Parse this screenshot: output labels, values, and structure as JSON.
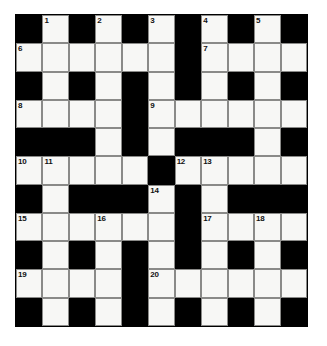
{
  "puzzle": {
    "type": "crossword-grid",
    "title": "Crossword Puzzle Grid",
    "rows": 11,
    "cols": 11,
    "colors": {
      "block": "#000000",
      "open": "#f7f7f5",
      "cell_border": "#8a8a88",
      "number_text": "#111111",
      "background": "#ffffff"
    },
    "legend": {
      "block_label": "blocked square",
      "open_label": "fillable square"
    },
    "grid": [
      [
        "block",
        "open",
        "block",
        "open",
        "block",
        "open",
        "block",
        "open",
        "block",
        "open",
        "block"
      ],
      [
        "open",
        "open",
        "open",
        "open",
        "open",
        "open",
        "block",
        "open",
        "open",
        "open",
        "open"
      ],
      [
        "block",
        "open",
        "block",
        "open",
        "block",
        "open",
        "block",
        "open",
        "block",
        "open",
        "block"
      ],
      [
        "open",
        "open",
        "open",
        "open",
        "block",
        "open",
        "open",
        "open",
        "open",
        "open",
        "open"
      ],
      [
        "block",
        "block",
        "block",
        "open",
        "block",
        "open",
        "block",
        "block",
        "block",
        "open",
        "block"
      ],
      [
        "open",
        "open",
        "open",
        "open",
        "open",
        "block",
        "open",
        "open",
        "open",
        "open",
        "open"
      ],
      [
        "block",
        "open",
        "block",
        "block",
        "block",
        "open",
        "block",
        "open",
        "block",
        "block",
        "block"
      ],
      [
        "open",
        "open",
        "open",
        "open",
        "open",
        "open",
        "block",
        "open",
        "open",
        "open",
        "open"
      ],
      [
        "block",
        "open",
        "block",
        "open",
        "block",
        "open",
        "block",
        "open",
        "block",
        "open",
        "block"
      ],
      [
        "open",
        "open",
        "open",
        "open",
        "block",
        "open",
        "open",
        "open",
        "open",
        "open",
        "open"
      ],
      [
        "block",
        "open",
        "block",
        "open",
        "block",
        "open",
        "block",
        "open",
        "block",
        "open",
        "block"
      ]
    ],
    "numbers": [
      {
        "n": "1",
        "row": 0,
        "col": 1
      },
      {
        "n": "2",
        "row": 0,
        "col": 3
      },
      {
        "n": "3",
        "row": 0,
        "col": 5
      },
      {
        "n": "4",
        "row": 0,
        "col": 7
      },
      {
        "n": "5",
        "row": 0,
        "col": 9
      },
      {
        "n": "6",
        "row": 1,
        "col": 0
      },
      {
        "n": "7",
        "row": 1,
        "col": 7
      },
      {
        "n": "8",
        "row": 3,
        "col": 0
      },
      {
        "n": "9",
        "row": 3,
        "col": 5
      },
      {
        "n": "10",
        "row": 5,
        "col": 0
      },
      {
        "n": "11",
        "row": 5,
        "col": 1
      },
      {
        "n": "12",
        "row": 5,
        "col": 6
      },
      {
        "n": "13",
        "row": 5,
        "col": 7
      },
      {
        "n": "14",
        "row": 6,
        "col": 5
      },
      {
        "n": "15",
        "row": 7,
        "col": 0
      },
      {
        "n": "16",
        "row": 7,
        "col": 3
      },
      {
        "n": "17",
        "row": 7,
        "col": 7
      },
      {
        "n": "18",
        "row": 7,
        "col": 9
      },
      {
        "n": "19",
        "row": 9,
        "col": 0
      },
      {
        "n": "20",
        "row": 9,
        "col": 5
      }
    ]
  }
}
